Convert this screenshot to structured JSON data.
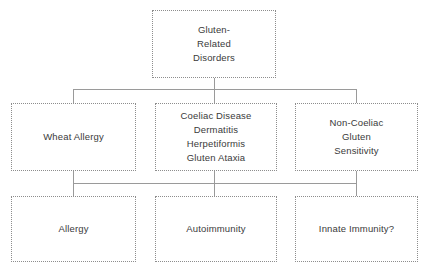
{
  "diagram": {
    "type": "flowchart",
    "orientation": "top-down",
    "levels": 3,
    "style": {
      "box_border": "#8d8d8d",
      "box_border_style": "dotted",
      "box_fill": "#ffffff",
      "text_color": "#3a3a3a",
      "connector_color": "#9a9a9a",
      "background": "#ffffff"
    },
    "nodes": {
      "root": {
        "id": "gluten-related-disorders",
        "lines": [
          "Gluten-",
          "Related",
          "Disorders"
        ]
      },
      "level2": [
        {
          "id": "wheat-allergy",
          "lines": [
            "Wheat Allergy"
          ]
        },
        {
          "id": "coeliac-disease",
          "lines": [
            "Coeliac Disease",
            "Dermatitis",
            "Herpetiformis",
            "Gluten Ataxia"
          ]
        },
        {
          "id": "non-coeliac-gluten-sensitivity",
          "lines": [
            "Non-Coeliac",
            "Gluten",
            "Sensitivity"
          ]
        }
      ],
      "level3": [
        {
          "id": "allergy",
          "lines": [
            "Allergy"
          ]
        },
        {
          "id": "autoimmunity",
          "lines": [
            "Autoimmunity"
          ]
        },
        {
          "id": "innate-immunity",
          "lines": [
            "Innate Immunity?"
          ]
        }
      ]
    }
  }
}
